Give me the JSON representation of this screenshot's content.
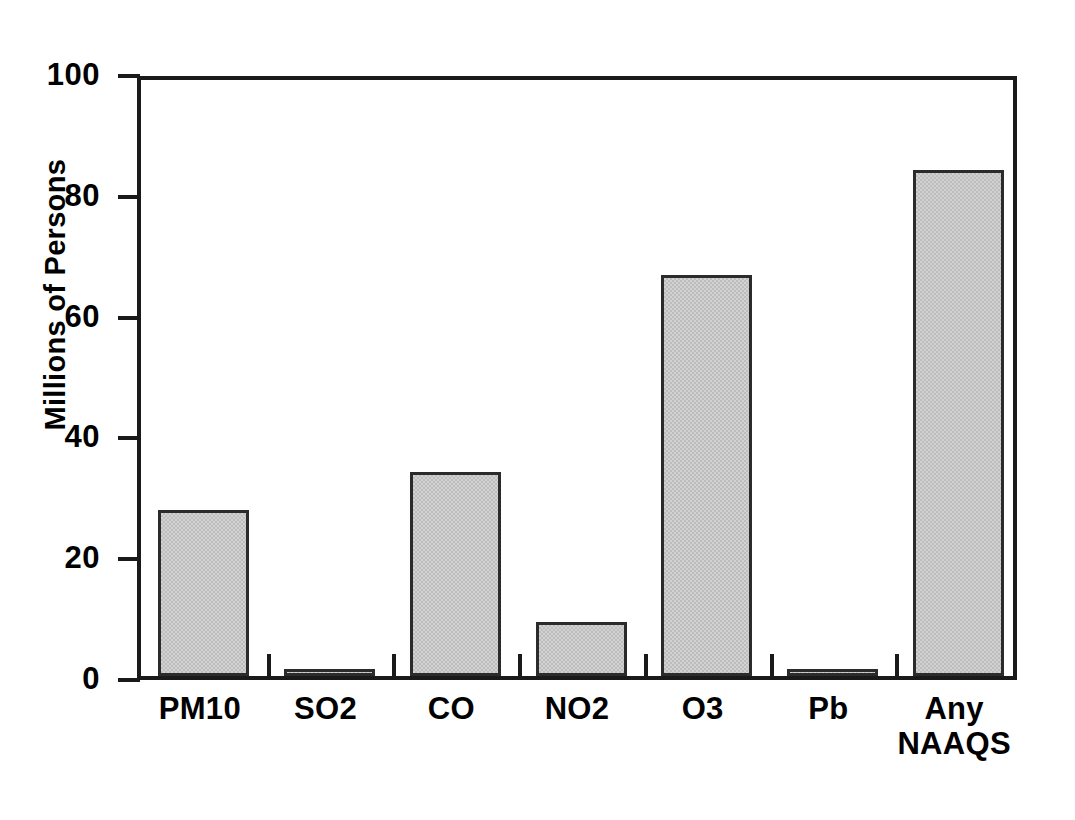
{
  "chart_data": {
    "type": "bar",
    "title": "",
    "subtitle": "",
    "xlabel": "",
    "ylabel": "Millions of Persons",
    "categories": [
      "PM10",
      "SO2",
      "CO",
      "NO2",
      "O3",
      "Pb",
      "Any\nNAAQS"
    ],
    "values": [
      27.5,
      1.0,
      33.8,
      8.9,
      66.4,
      1.2,
      83.8
    ],
    "ylim": [
      0,
      100
    ],
    "yticks": [
      0,
      20,
      40,
      60,
      80,
      100
    ],
    "ytick_labels": [
      "0",
      "20",
      "40",
      "60",
      "80",
      "100"
    ],
    "grid": false,
    "legend": null,
    "annotations": [],
    "series": [
      {
        "name": "Population exposed",
        "values": [
          27.5,
          1.0,
          33.8,
          8.9,
          66.4,
          1.2,
          83.8
        ]
      }
    ],
    "bar_fill_color": "#d2d2d2",
    "bar_edge_color": "#2b2b2b",
    "axis_color": "#1a1a1a",
    "background_color": "#ffffff"
  }
}
